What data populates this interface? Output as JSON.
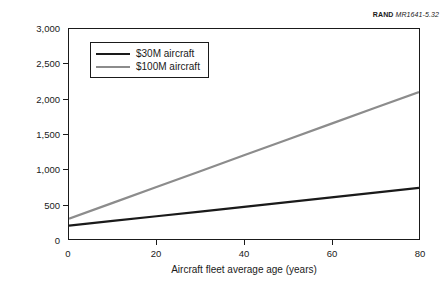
{
  "figure": {
    "mark": "RAND",
    "code": "MR1641-5.32"
  },
  "chart_data": {
    "type": "line",
    "title": "",
    "xlabel": "Aircraft fleet average age (years)",
    "ylabel": "CLS flying hour cost ($FY98/FH)",
    "xlim": [
      0,
      80
    ],
    "ylim": [
      0,
      3000
    ],
    "xticks": [
      0,
      20,
      40,
      60,
      80
    ],
    "yticks": [
      0,
      500,
      1000,
      1500,
      2000,
      2500,
      3000
    ],
    "xticklabels": [
      "0",
      "20",
      "40",
      "60",
      "80"
    ],
    "yticklabels": [
      "0",
      "500",
      "1,000",
      "1,500",
      "2,000",
      "2,500",
      "3,000"
    ],
    "grid": false,
    "legend_position": "upper left",
    "x": [
      0,
      10,
      20,
      30,
      40,
      50,
      60,
      70,
      80
    ],
    "series": [
      {
        "name": "$30M aircraft",
        "color": "#1a1a1a",
        "linewidth": 2.2,
        "values": [
          190,
          258,
          325,
          392,
          460,
          527,
          595,
          662,
          730
        ]
      },
      {
        "name": "$100M aircraft",
        "color": "#8c8c8c",
        "linewidth": 2.2,
        "values": [
          290,
          516,
          742,
          969,
          1195,
          1421,
          1648,
          1874,
          2100
        ]
      }
    ]
  }
}
